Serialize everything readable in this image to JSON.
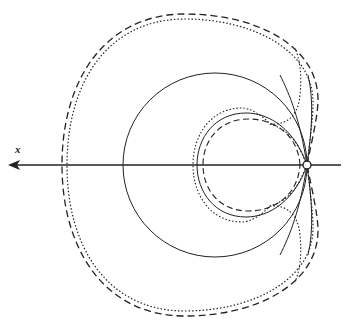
{
  "figure": {
    "axis_label": "x",
    "colors": {
      "ink": "#222222",
      "background": "#ffffff"
    },
    "axis": {
      "y": 165,
      "x_start": 8,
      "x_end": 341,
      "arrow": "left"
    },
    "origin_marker": {
      "cx": 307,
      "cy": 165,
      "r": 4
    },
    "curves": {
      "solid_large_circle": {
        "cx": 215,
        "cy": 165,
        "r": 92,
        "style": "solid"
      },
      "solid_inner_loop": {
        "style": "solid"
      },
      "dashed_inner_loop": {
        "style": "dashed"
      },
      "dotted_inner_loop": {
        "style": "dotted"
      },
      "dashed_outer": {
        "style": "dashed"
      },
      "dotted_outer": {
        "style": "dotted"
      }
    }
  }
}
